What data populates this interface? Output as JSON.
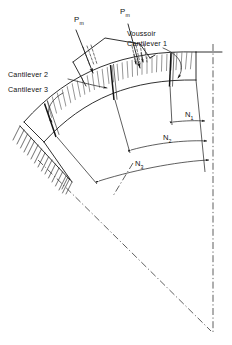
{
  "figure": {
    "background_color": "#ffffff",
    "line_color": "#1a1a1a"
  },
  "labels": {
    "voussoir_line1": "Voussoir",
    "voussoir_line2": "Cantilever 1",
    "cantilever_2": "Cantilever 2",
    "cantilever_3": "Cantilever 3",
    "load_left": "P",
    "load_left_sub": "m",
    "load_right": "P",
    "load_right_sub": "m"
  },
  "dimensions": [
    {
      "name": "N",
      "subscript": "1",
      "label": "N1"
    },
    {
      "name": "N",
      "subscript": "2",
      "label": "N2"
    },
    {
      "name": "N",
      "subscript": "3",
      "label": "N3"
    }
  ],
  "elements": {
    "abutment": "fixed-support-hatching",
    "centerline_vertical": "dash-dot",
    "centerline_radial": "dash-dot",
    "band_fill": "radial-hatching"
  }
}
